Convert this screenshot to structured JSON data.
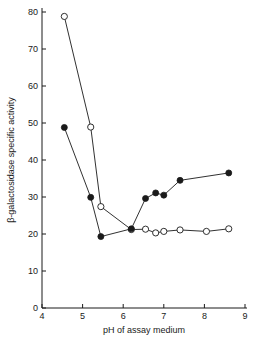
{
  "chart_data": {
    "type": "line",
    "title": "",
    "xlabel": "pH of assay medium",
    "ylabel": "β-galactosidase specific activity",
    "xlim": [
      4,
      9
    ],
    "ylim": [
      0,
      80
    ],
    "xticks": [
      "4",
      "5",
      "6",
      "7",
      "8",
      "9"
    ],
    "yticks": [
      "0",
      "10",
      "20",
      "30",
      "40",
      "50",
      "60",
      "70",
      "80"
    ],
    "grid": false,
    "legend": "none",
    "series": [
      {
        "name": "open-circles",
        "marker": "open-circle",
        "color": "#1a1a1a",
        "points": [
          {
            "x": 4.55,
            "y": 78.8
          },
          {
            "x": 5.2,
            "y": 48.9
          },
          {
            "x": 5.45,
            "y": 27.4
          },
          {
            "x": 6.2,
            "y": 21.2
          },
          {
            "x": 6.55,
            "y": 21.3
          },
          {
            "x": 6.8,
            "y": 20.3
          },
          {
            "x": 7.0,
            "y": 20.7
          },
          {
            "x": 7.4,
            "y": 21.1
          },
          {
            "x": 8.05,
            "y": 20.7
          },
          {
            "x": 8.6,
            "y": 21.4
          }
        ]
      },
      {
        "name": "filled-circles",
        "marker": "filled-circle",
        "color": "#1a1a1a",
        "points": [
          {
            "x": 4.55,
            "y": 48.8
          },
          {
            "x": 5.2,
            "y": 29.9
          },
          {
            "x": 5.45,
            "y": 19.3
          },
          {
            "x": 6.2,
            "y": 21.4
          },
          {
            "x": 6.55,
            "y": 29.6
          },
          {
            "x": 6.8,
            "y": 31.1
          },
          {
            "x": 7.0,
            "y": 30.5
          },
          {
            "x": 7.4,
            "y": 34.5
          },
          {
            "x": 8.6,
            "y": 36.5
          }
        ]
      }
    ]
  }
}
